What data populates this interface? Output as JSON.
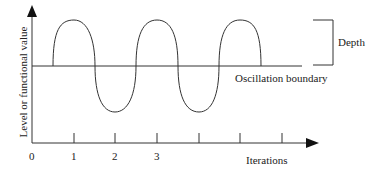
{
  "diagram": {
    "y_axis_label": "Level or functional value",
    "x_axis_label": "Iterations",
    "origin_label": "0",
    "tick_labels": [
      "1",
      "2",
      "3",
      "",
      "",
      ""
    ],
    "boundary_label": "Oscillation boundary",
    "depth_label": "Depth",
    "colors": {
      "line": "#333333",
      "text": "#222222",
      "background": "#ffffff"
    }
  }
}
